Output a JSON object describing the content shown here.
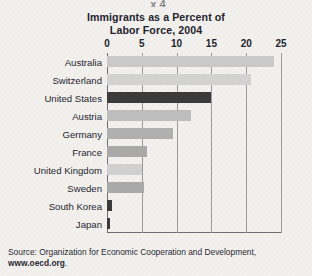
{
  "figure": {
    "top_clipped_text": "x 4",
    "background_color": "#f3f1ee",
    "title_line1": "Immigrants as a Percent of",
    "title_line2": "Labor Force, 2004",
    "source_prefix": "Source: Organization for Economic Cooperation and Development,",
    "source_url": "www.oecd.org",
    "source_suffix": "."
  },
  "chart_data": {
    "type": "bar",
    "orientation": "horizontal",
    "title": "Immigrants as a Percent of Labor Force, 2004",
    "xlabel": "",
    "ylabel": "",
    "xlim": [
      0,
      25
    ],
    "xticks": [
      0,
      5,
      10,
      15,
      20,
      25
    ],
    "tick_labels": [
      "0",
      "5",
      "10",
      "15",
      "20",
      "25"
    ],
    "grid": "vertical",
    "legend": "none",
    "categories": [
      "Australia",
      "Switzerland",
      "United States",
      "Austria",
      "Germany",
      "France",
      "United Kingdom",
      "Sweden",
      "South Korea",
      "Japan"
    ],
    "values": [
      24.0,
      20.7,
      15.0,
      12.0,
      9.5,
      5.7,
      5.0,
      5.3,
      0.7,
      0.4
    ],
    "bar_colors": [
      "#c9c9c9",
      "#d2d2d2",
      "#3b3b3b",
      "#bdbdbd",
      "#b0b0b0",
      "#a9a9a9",
      "#d0d0d0",
      "#a9a9a9",
      "#3b3b3b",
      "#3b3b3b"
    ],
    "highlight_category": "United States",
    "highlight_color": "#3b3b3b"
  }
}
